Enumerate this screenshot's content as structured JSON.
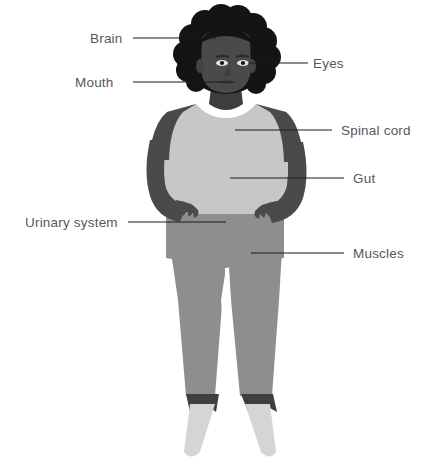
{
  "illustration": {
    "title": "Human body anatomy diagram",
    "subject": "standing person with hands on hips",
    "background_color": "#ffffff",
    "palette": {
      "hair": "#141414",
      "skin": "#4a4a4a",
      "skin_shadow": "#3d3d3d",
      "top": "#c7c7c7",
      "pants": "#8e8e8e",
      "socks": "#3f3f3f",
      "shoes": "#d4d6d3",
      "eye_white": "#e8e8e8",
      "leader_line": "#1a1a1a",
      "label_text": "#58585b"
    }
  },
  "callouts": [
    {
      "id": "brain",
      "label": "Brain",
      "side": "left",
      "label_x": 90,
      "label_y": 32,
      "line_x1": 133,
      "line_x2": 216,
      "line_y": 38
    },
    {
      "id": "mouth",
      "label": "Mouth",
      "side": "left",
      "label_x": 75,
      "label_y": 76,
      "line_x1": 133,
      "line_x2": 222,
      "line_y": 82
    },
    {
      "id": "eyes",
      "label": "Eyes",
      "side": "right",
      "label_x": 313,
      "label_y": 57,
      "line_x1": 249,
      "line_x2": 308,
      "line_y": 63
    },
    {
      "id": "spinal-cord",
      "label": "Spinal cord",
      "side": "right",
      "label_x": 341,
      "label_y": 124,
      "line_x1": 235,
      "line_x2": 332,
      "line_y": 130
    },
    {
      "id": "gut",
      "label": "Gut",
      "side": "right",
      "label_x": 353,
      "label_y": 172,
      "line_x1": 230,
      "line_x2": 344,
      "line_y": 178
    },
    {
      "id": "urinary-system",
      "label": "Urinary system",
      "side": "left",
      "label_x": 25,
      "label_y": 216,
      "line_x1": 128,
      "line_x2": 226,
      "line_y": 222
    },
    {
      "id": "muscles",
      "label": "Muscles",
      "side": "right",
      "label_x": 353,
      "label_y": 247,
      "line_x1": 251,
      "line_x2": 344,
      "line_y": 253
    }
  ]
}
